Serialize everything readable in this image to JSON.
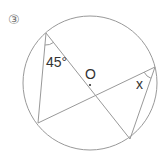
{
  "problem": {
    "number_label": "③"
  },
  "circle": {
    "center_label": "O",
    "cx": 90,
    "cy": 83,
    "r": 67
  },
  "points": {
    "A": [
      46,
      33
    ],
    "B": [
      38,
      123
    ],
    "C": [
      130,
      139
    ],
    "D": [
      155,
      67
    ]
  },
  "chords": [
    [
      "A",
      "B"
    ],
    [
      "A",
      "C"
    ],
    [
      "B",
      "D"
    ],
    [
      "D",
      "C"
    ]
  ],
  "angles": {
    "known": {
      "vertex": "A",
      "label": "45°"
    },
    "unknown": {
      "vertex": "D",
      "label": "x"
    }
  },
  "colors": {
    "line": "#999999",
    "text": "#333333"
  }
}
